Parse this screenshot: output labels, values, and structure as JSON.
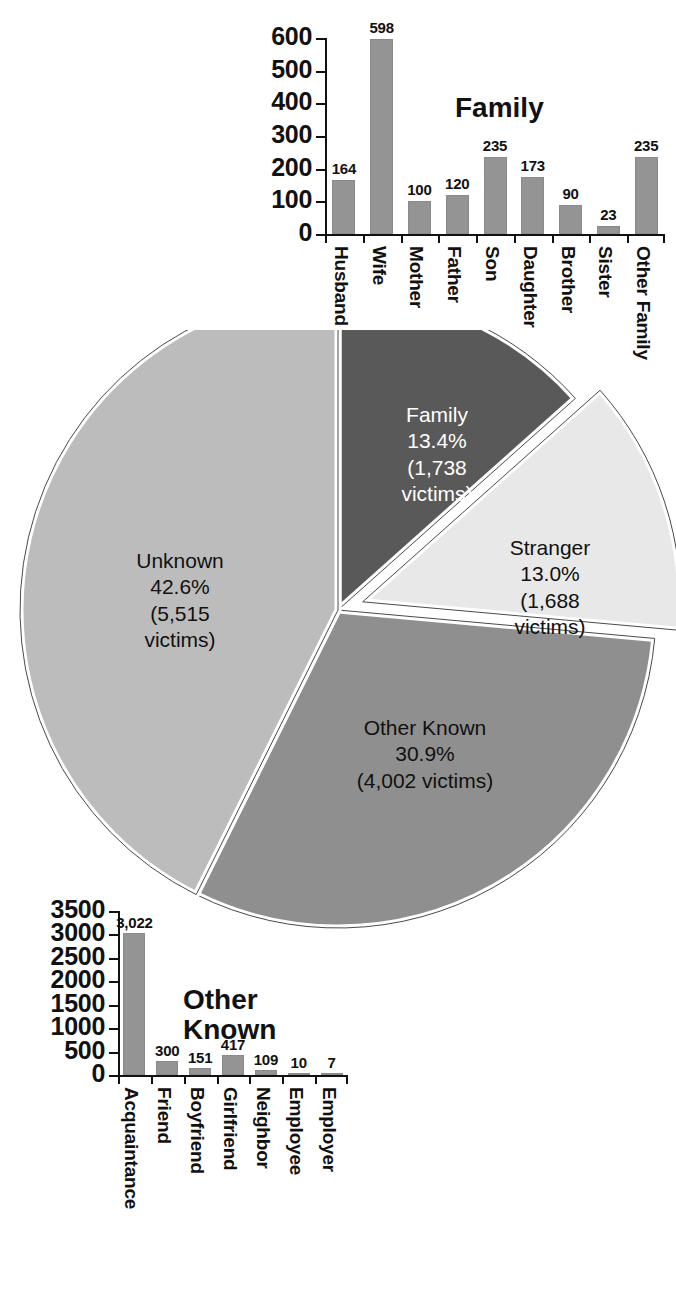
{
  "chart_data": [
    {
      "type": "bar",
      "title": "Family",
      "categories": [
        "Husband",
        "Wife",
        "Mother",
        "Father",
        "Son",
        "Daughter",
        "Brother",
        "Sister",
        "Other Family"
      ],
      "values": [
        164,
        598,
        100,
        120,
        235,
        173,
        90,
        23,
        235
      ],
      "value_labels": [
        "164",
        "598",
        "100",
        "120",
        "235",
        "173",
        "90",
        "23",
        "235"
      ],
      "xlabel": "",
      "ylabel": "",
      "ylim": [
        0,
        600
      ],
      "yticks": [
        0,
        100,
        200,
        300,
        400,
        500,
        600
      ],
      "ytick_labels": [
        "0",
        "100",
        "200",
        "300",
        "400",
        "500",
        "600"
      ],
      "grid": false,
      "legend": "none",
      "bar_color": "#949494"
    },
    {
      "type": "pie",
      "title": "",
      "slices": [
        {
          "name": "Family",
          "percent": 13.4,
          "victims": "1,738",
          "label": "Family\n13.4%\n(1,738\nvictims)",
          "color": "#595959",
          "exploded": false
        },
        {
          "name": "Stranger",
          "percent": 13.0,
          "victims": "1,688",
          "label": "Stranger\n13.0%\n(1,688\nvictims)",
          "color": "#e8e8e8",
          "exploded": true
        },
        {
          "name": "Other Known",
          "percent": 30.9,
          "victims": "4,002",
          "label": "Other Known\n30.9%\n(4,002 victims)",
          "color": "#8f8f8f",
          "exploded": false
        },
        {
          "name": "Unknown",
          "percent": 42.6,
          "victims": "5,515",
          "label": "Unknown\n42.6%\n(5,515\nvictims)",
          "color": "#bcbcbc",
          "exploded": false
        }
      ],
      "legend": "none"
    },
    {
      "type": "bar",
      "title": "Other\nKnown",
      "categories": [
        "Acquaintance",
        "Friend",
        "Boyfriend",
        "Girlfriend",
        "Neighbor",
        "Employee",
        "Employer"
      ],
      "values": [
        3022,
        300,
        151,
        417,
        109,
        10,
        7
      ],
      "value_labels": [
        "3,022",
        "300",
        "151",
        "417",
        "109",
        "10",
        "7"
      ],
      "xlabel": "",
      "ylabel": "",
      "ylim": [
        0,
        3500
      ],
      "yticks": [
        0,
        500,
        1000,
        1500,
        2000,
        2500,
        3000,
        3500
      ],
      "ytick_labels": [
        "0",
        "500",
        "1000",
        "1500",
        "2000",
        "2500",
        "3000",
        "3500"
      ],
      "grid": false,
      "legend": "none",
      "bar_color": "#949494"
    }
  ]
}
